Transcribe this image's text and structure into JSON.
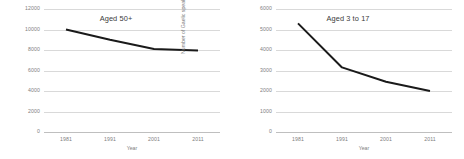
{
  "figure": {
    "panels": [
      "left",
      "right"
    ]
  },
  "chart_data": [
    {
      "type": "line",
      "title": "Aged 50+",
      "xlabel": "Year",
      "ylabel": "Number of Gaelic speakers",
      "categories": [
        "1981",
        "1991",
        "2001",
        "2011"
      ],
      "x": [
        1981,
        1991,
        2001,
        2011
      ],
      "values": [
        10000,
        9000,
        8100,
        7950
      ],
      "ylim": [
        0,
        12000
      ],
      "yticks": [
        "0",
        "2000",
        "4000",
        "6000",
        "8000",
        "10000",
        "12000"
      ],
      "ytick_values": [
        0,
        2000,
        4000,
        6000,
        8000,
        10000,
        12000
      ],
      "xticks": [
        "1981",
        "1991",
        "2001",
        "2011"
      ],
      "grid": true,
      "legend": false,
      "line_color": "#1a1a1a",
      "grid_color": "#d9d9d9",
      "text_color": "#808080"
    },
    {
      "type": "line",
      "title": "Aged 3 to 17",
      "xlabel": "Year",
      "ylabel": "Number of Gaelic speakers",
      "categories": [
        "1981",
        "1991",
        "2001",
        "2011"
      ],
      "x": [
        1981,
        1991,
        2001,
        2011
      ],
      "values": [
        5300,
        3150,
        2450,
        2000
      ],
      "ylim": [
        0,
        6000
      ],
      "yticks": [
        "0",
        "1000",
        "2000",
        "3000",
        "4000",
        "5000",
        "6000"
      ],
      "ytick_values": [
        0,
        1000,
        2000,
        3000,
        4000,
        5000,
        6000
      ],
      "xticks": [
        "1981",
        "1991",
        "2001",
        "2011"
      ],
      "grid": true,
      "legend": false,
      "line_color": "#1a1a1a",
      "grid_color": "#d9d9d9",
      "text_color": "#808080"
    }
  ]
}
